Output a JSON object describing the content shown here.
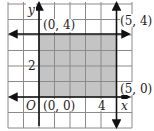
{
  "figure": {
    "type": "coordinate-graph",
    "grid": {
      "x_min": -2,
      "x_max": 6,
      "y_min": -2,
      "y_max": 6,
      "step": 1,
      "on": true
    },
    "axes": {
      "x_label": "x",
      "y_label": "y",
      "origin_label": "O"
    },
    "tick_labels": [
      {
        "axis": "x",
        "value": 4,
        "text": "4"
      },
      {
        "axis": "y",
        "value": 2,
        "text": "2"
      }
    ],
    "boundary_lines": [
      {
        "name": "y-axis",
        "equation": "x = 0"
      },
      {
        "name": "x-axis",
        "equation": "y = 0"
      },
      {
        "name": "vertical-line",
        "equation": "x = 5"
      },
      {
        "name": "horizontal-line",
        "equation": "y = 4"
      }
    ],
    "vertices": [
      {
        "x": 0,
        "y": 4,
        "label": "(0, 4)"
      },
      {
        "x": 5,
        "y": 4,
        "label": "(5, 4)"
      },
      {
        "x": 5,
        "y": 0,
        "label": "(5, 0)"
      },
      {
        "x": 0,
        "y": 0,
        "label": "(0, 0)"
      }
    ],
    "shaded_region": {
      "x_from": 0,
      "x_to": 5,
      "y_from": 0,
      "y_to": 4
    },
    "colors": {
      "grid": "#8a8a8a",
      "axes": "#111111",
      "shade": "#c4c4c4",
      "text": "#222222"
    }
  },
  "labels": {
    "y_axis": "y",
    "x_axis": "x",
    "origin": "O",
    "tick_2": "2",
    "tick_4": "4",
    "v_0_4": "(0, 4)",
    "v_5_4": "(5, 4)",
    "v_5_0": "(5, 0)",
    "v_0_0": "(0, 0)"
  }
}
